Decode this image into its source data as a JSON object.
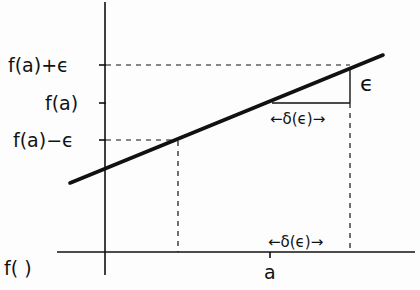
{
  "diagram": {
    "y_labels": {
      "upper": "f(a)+ϵ",
      "middle": "f(a)",
      "lower": "f(a)−ϵ"
    },
    "x_axis_label": "f( )",
    "x_tick_label": "a",
    "epsilon_label": "ϵ",
    "delta_label_upper": "←δ(ϵ)→",
    "delta_label_lower": "←δ(ϵ)→",
    "colors": {
      "ink": "#111111",
      "background": "#fdfdfd"
    }
  }
}
